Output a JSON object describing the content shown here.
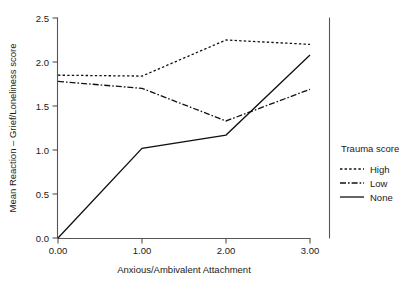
{
  "chart_data": {
    "type": "line",
    "title": "",
    "xlabel": "Anxious/Ambivalent Attachment",
    "ylabel": "Mean Reaction – Grief/Loneliness score",
    "x": [
      0,
      1,
      2,
      3
    ],
    "xtick_labels": [
      "0.00",
      "1.00",
      "2.00",
      "3.00"
    ],
    "ytick_labels": [
      "0.0",
      "0.5",
      "1.0",
      "1.5",
      "2.0",
      "2.5"
    ],
    "ytick_values": [
      0.0,
      0.5,
      1.0,
      1.5,
      2.0,
      2.5
    ],
    "xlim": [
      0,
      3
    ],
    "ylim": [
      0.0,
      2.5
    ],
    "grid": false,
    "legend_position": "right",
    "legend_title": "Trauma score",
    "series": [
      {
        "name": "High",
        "style": "dotted",
        "color": "#111111",
        "values": [
          1.85,
          1.84,
          2.25,
          2.2
        ]
      },
      {
        "name": "Low",
        "style": "dash-dot",
        "color": "#111111",
        "values": [
          1.78,
          1.7,
          1.33,
          1.69
        ]
      },
      {
        "name": "None",
        "style": "solid",
        "color": "#111111",
        "values": [
          0.0,
          1.02,
          1.17,
          2.08
        ]
      }
    ]
  },
  "axes": {
    "y_title": "Mean Reaction – Grief/Loneliness score",
    "x_title": "Anxious/Ambivalent Attachment",
    "y_ticks": [
      {
        "label": "2.5",
        "value": 2.5
      },
      {
        "label": "2.0",
        "value": 2.0
      },
      {
        "label": "1.5",
        "value": 1.5
      },
      {
        "label": "1.0",
        "value": 1.0
      },
      {
        "label": "0.5",
        "value": 0.5
      },
      {
        "label": "0.0",
        "value": 0.0
      }
    ],
    "x_ticks": [
      {
        "label": "0.00",
        "value": 0
      },
      {
        "label": "1.00",
        "value": 1
      },
      {
        "label": "2.00",
        "value": 2
      },
      {
        "label": "3.00",
        "value": 3
      }
    ]
  },
  "legend": {
    "title": "Trauma score",
    "entries": [
      {
        "label": "High",
        "style": "dotted"
      },
      {
        "label": "Low",
        "style": "dash-dot"
      },
      {
        "label": "None",
        "style": "solid"
      }
    ]
  }
}
